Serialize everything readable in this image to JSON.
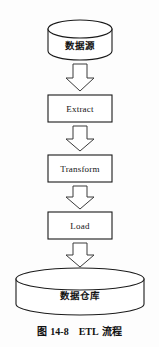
{
  "figure": {
    "caption_prefix": "图",
    "caption_number": "14-8",
    "caption_tech": "ETL",
    "caption_suffix": "流程",
    "caption_full": "图 14-8　ETL 流程"
  },
  "diagram": {
    "type": "flowchart",
    "orientation": "vertical-top-to-bottom",
    "background_color": "#fdfdfd",
    "stroke_color": "#1b1b1b",
    "fill_color": "#ffffff",
    "nodes": [
      {
        "id": "source",
        "label": "数据源",
        "shape": "cylinder",
        "x": 48,
        "y": 20,
        "width": 64,
        "height": 40
      },
      {
        "id": "extract",
        "label": "Extract",
        "shape": "rectangle",
        "x": 48,
        "y": 95,
        "width": 64,
        "height": 27
      },
      {
        "id": "transform",
        "label": "Transform",
        "shape": "rectangle",
        "x": 48,
        "y": 155,
        "width": 64,
        "height": 27
      },
      {
        "id": "load",
        "label": "Load",
        "shape": "rectangle",
        "x": 48,
        "y": 212,
        "width": 64,
        "height": 27
      },
      {
        "id": "warehouse",
        "label": "数据仓库",
        "shape": "cylinder",
        "x": 16,
        "y": 268,
        "width": 128,
        "height": 47
      }
    ],
    "arrows": [
      {
        "id": "arrow-source-extract",
        "from": "source",
        "to": "extract",
        "style": "hollow-block-down"
      },
      {
        "id": "arrow-extract-transform",
        "from": "extract",
        "to": "transform",
        "style": "hollow-block-down"
      },
      {
        "id": "arrow-transform-load",
        "from": "transform",
        "to": "load",
        "style": "hollow-block-down"
      },
      {
        "id": "arrow-load-warehouse",
        "from": "load",
        "to": "warehouse",
        "style": "hollow-block-down"
      }
    ]
  }
}
